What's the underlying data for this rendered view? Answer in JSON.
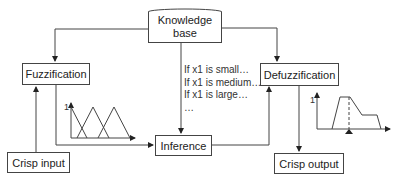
{
  "diagram": {
    "nodes": {
      "knowledge_base": {
        "line1": "Knowledge",
        "line2": "base"
      },
      "fuzzification": "Fuzzification",
      "defuzzification": "Defuzzification",
      "inference": "Inference",
      "crisp_input": "Crisp input",
      "crisp_output": "Crisp output"
    },
    "rules": [
      "If x1 is small…",
      "If x1 is medium…",
      "If x1 is large…",
      "…"
    ],
    "membership_plot": {
      "y_tick": "1"
    },
    "output_plot": {
      "y_tick": "1"
    },
    "colors": {
      "line": "#444444",
      "text": "#222222",
      "background": "#ffffff"
    }
  }
}
